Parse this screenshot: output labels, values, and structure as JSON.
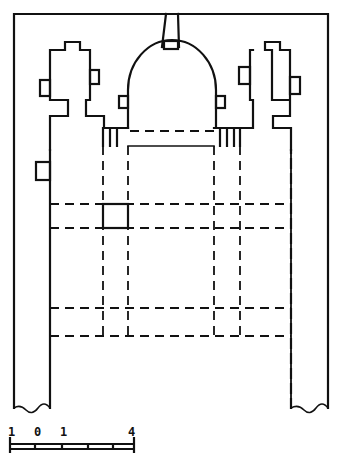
{
  "diagram": {
    "type": "architectural-floor-plan",
    "line_color": "#111111",
    "background": "#ffffff"
  },
  "scale_bar": {
    "labels": [
      "1",
      "0",
      "1",
      "4"
    ]
  }
}
